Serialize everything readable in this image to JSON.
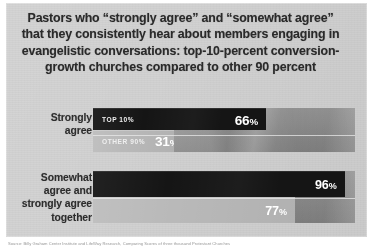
{
  "figure": {
    "title_lines": [
      "Pastors who “strongly agree” and “somewhat agree”",
      "that they consistently hear about members engaging in",
      "evangelistic conversations: top-10-percent conversion-",
      "growth churches compared to other 90 percent"
    ],
    "source_note": "Source: Billy Graham Center Institute and LifeWay Research, Comparing Scores of three thousand Protestant Churches",
    "colors": {
      "panel_background": "#d2d2d2",
      "track": "#8f8f8f",
      "series_top10": "#151515",
      "series_other90": "#b9b9b9",
      "title_text": "#2a2a2a",
      "value_text": "#ffffff"
    }
  },
  "chart_data": {
    "type": "bar",
    "orientation": "horizontal",
    "xlabel": "",
    "ylabel": "",
    "xlim": [
      0,
      100
    ],
    "grid": false,
    "legend": "in-bar labels",
    "unit": "%",
    "categories": [
      "Strongly agree",
      "Somewhat agree and strongly agree together"
    ],
    "category_label_lines": [
      [
        "Strongly",
        "agree"
      ],
      [
        "Somewhat",
        "agree and",
        "strongly agree",
        "together"
      ]
    ],
    "series": [
      {
        "name": "TOP 10%",
        "tag": "TOP 10%",
        "color": "#151515",
        "values": [
          66,
          96
        ],
        "value_labels": [
          "66%",
          "96%"
        ]
      },
      {
        "name": "OTHER 90%",
        "tag": "OTHER 90%",
        "color": "#b9b9b9",
        "values": [
          31,
          77
        ],
        "value_labels": [
          "31%",
          "77%"
        ]
      }
    ]
  }
}
